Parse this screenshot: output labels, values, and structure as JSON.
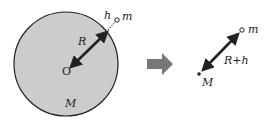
{
  "diagram": {
    "left": {
      "center_label": "O",
      "radius_label": "R",
      "height_label": "h",
      "object_label": "m",
      "planet_mass_label": "M"
    },
    "transform_arrow": "right-arrow",
    "right": {
      "object_label": "m",
      "distance_label": "R+h",
      "planet_mass_label": "M"
    },
    "colors": {
      "planet_fill": "#cccccc",
      "outline": "#222222",
      "block_arrow": "#777777"
    }
  }
}
